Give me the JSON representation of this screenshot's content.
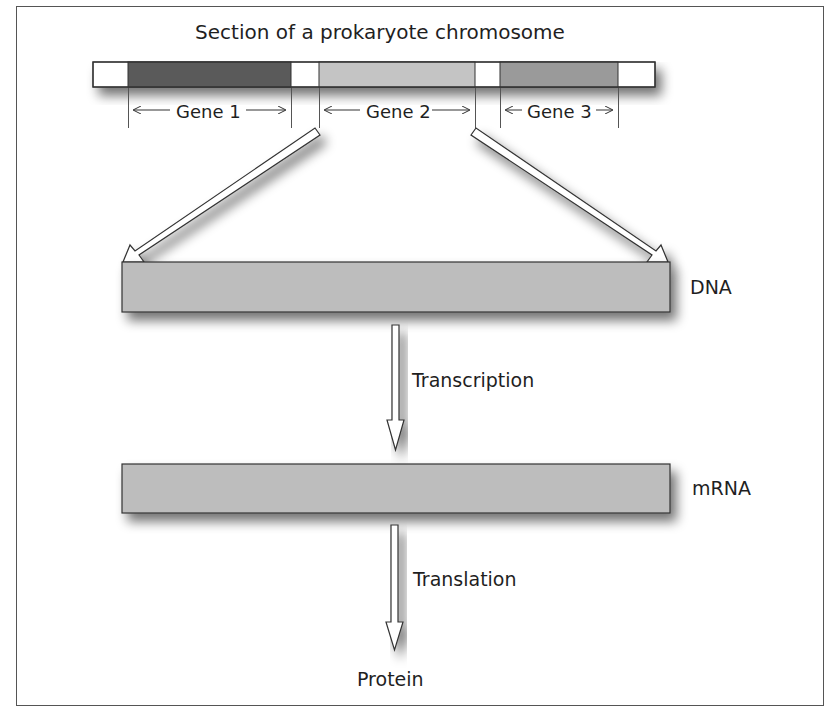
{
  "title": "Section of a prokaryote chromosome",
  "chromosome": {
    "segments": [
      {
        "kind": "spacer",
        "x0": 93,
        "x1": 128,
        "color": "#ffffff"
      },
      {
        "kind": "gene",
        "label": "Gene 1",
        "x0": 128,
        "x1": 291,
        "color": "#5a5a5a"
      },
      {
        "kind": "spacer",
        "x0": 291,
        "x1": 319,
        "color": "#ffffff"
      },
      {
        "kind": "gene",
        "label": "Gene 2",
        "x0": 319,
        "x1": 475,
        "color": "#c4c4c4"
      },
      {
        "kind": "spacer",
        "x0": 475,
        "x1": 500,
        "color": "#ffffff"
      },
      {
        "kind": "gene",
        "label": "Gene 3",
        "x0": 500,
        "x1": 618,
        "color": "#9a9a9a"
      },
      {
        "kind": "spacer",
        "x0": 618,
        "x1": 655,
        "color": "#ffffff"
      }
    ]
  },
  "genes": {
    "gene1": "Gene 1",
    "gene2": "Gene 2",
    "gene3": "Gene 3"
  },
  "boxes": {
    "dna_label": "DNA",
    "mrna_label": "mRNA",
    "fill_color": "#bdbdbd"
  },
  "steps": {
    "transcription": "Transcription",
    "translation": "Translation",
    "product": "Protein"
  }
}
